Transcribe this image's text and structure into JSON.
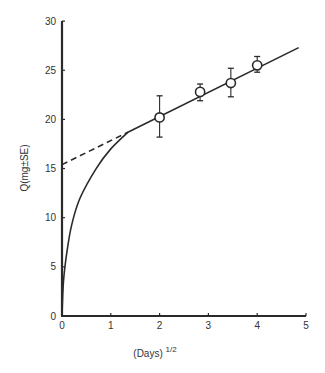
{
  "chart_data": {
    "type": "scatter",
    "title": "",
    "xlabel": "(Days)",
    "xlabel_superscript": "1/2",
    "ylabel": "Q(mg±SE)",
    "xlim": [
      0,
      5
    ],
    "ylim": [
      0,
      30
    ],
    "x_ticks": [
      "0",
      "1",
      "2",
      "3",
      "4",
      "5"
    ],
    "y_ticks": [
      "0",
      "5",
      "10",
      "15",
      "20",
      "25",
      "30"
    ],
    "grid": false,
    "legend": null,
    "series": [
      {
        "name": "Observed (mean ± SE)",
        "kind": "scatter_errorbar",
        "marker": "open-circle",
        "points": [
          {
            "x": 2.0,
            "y": 20.2,
            "y_low": 18.2,
            "y_high": 22.4
          },
          {
            "x": 2.83,
            "y": 22.8,
            "y_low": 21.9,
            "y_high": 23.6
          },
          {
            "x": 3.46,
            "y": 23.7,
            "y_low": 22.3,
            "y_high": 25.2
          },
          {
            "x": 4.0,
            "y": 25.5,
            "y_low": 24.8,
            "y_high": 26.4
          }
        ]
      },
      {
        "name": "Linear fit",
        "kind": "line",
        "style": "solid",
        "points": [
          {
            "x": 1.35,
            "y": 18.7
          },
          {
            "x": 4.85,
            "y": 27.3
          }
        ]
      },
      {
        "name": "Extrapolation to intercept",
        "kind": "line",
        "style": "dashed",
        "points": [
          {
            "x": 0.0,
            "y": 15.4
          },
          {
            "x": 1.35,
            "y": 18.7
          }
        ]
      },
      {
        "name": "Early-phase curve",
        "kind": "line",
        "style": "solid",
        "points": [
          {
            "x": 0.0,
            "y": 0.0
          },
          {
            "x": 0.03,
            "y": 3.5
          },
          {
            "x": 0.1,
            "y": 6.5
          },
          {
            "x": 0.2,
            "y": 9.3
          },
          {
            "x": 0.37,
            "y": 12.0
          },
          {
            "x": 0.7,
            "y": 15.0
          },
          {
            "x": 1.0,
            "y": 17.0
          },
          {
            "x": 1.35,
            "y": 18.7
          }
        ]
      }
    ],
    "annotations": []
  }
}
